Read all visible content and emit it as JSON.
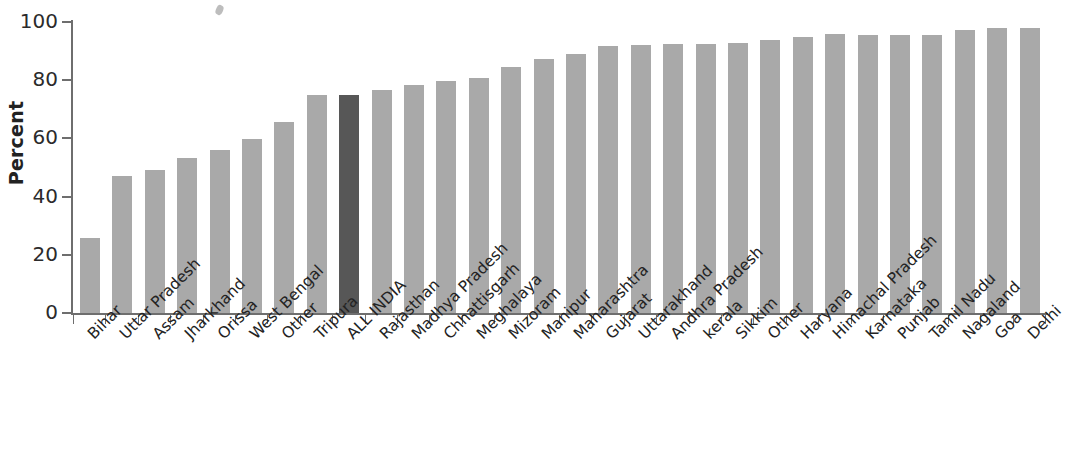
{
  "chart_data": {
    "type": "bar",
    "title": "",
    "subtitle": "",
    "xlabel": "",
    "ylabel": "Percent",
    "ylim": [
      0,
      100
    ],
    "yticks": [
      0,
      20,
      40,
      60,
      80,
      100
    ],
    "grid": false,
    "legend": null,
    "highlight_category": "ALL INDIA",
    "colors": {
      "bar": "#a9a9a9",
      "highlight_bar": "#575757",
      "axis": "#6e6e6e",
      "text": "#232323",
      "background": "#ffffff"
    },
    "categories": [
      "Bihar",
      "Uttar Pradesh",
      "Assam",
      "Jharkhand",
      "Orissa",
      "West Bengal",
      "Other",
      "Tripura",
      "ALL INDIA",
      "Rajasthan",
      "Madhya Pradesh",
      "Chhattisgarh",
      "Meghalaya",
      "Mizoram",
      "Manipur",
      "Maharashtra",
      "Gujarat",
      "Uttarakhand",
      "Andhra Pradesh",
      "kerala",
      "Sikkim",
      "Other",
      "Haryana",
      "Himachal Pradesh",
      "Karnataka",
      "Punjab",
      "Tamil Nadu",
      "Nagaland",
      "Goa",
      "Delhi"
    ],
    "values": [
      25.8,
      47.2,
      49.2,
      53.4,
      56.0,
      59.8,
      65.6,
      74.8,
      74.8,
      76.8,
      78.4,
      79.6,
      80.8,
      84.4,
      87.4,
      89.0,
      91.8,
      92.0,
      92.6,
      92.6,
      92.7,
      93.7,
      94.8,
      95.8,
      95.6,
      95.5,
      95.7,
      97.2,
      98.0,
      98.0
    ]
  }
}
